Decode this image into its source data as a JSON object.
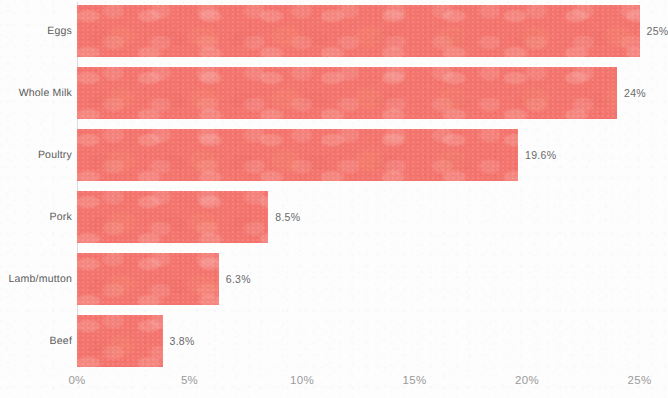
{
  "chart_data": {
    "type": "bar",
    "orientation": "horizontal",
    "title": "",
    "subtitle": "",
    "xlabel": "",
    "ylabel": "",
    "categories": [
      "Eggs",
      "Whole Milk",
      "Poultry",
      "Pork",
      "Lamb/mutton",
      "Beef"
    ],
    "values": [
      25,
      24,
      19.6,
      8.5,
      6.3,
      3.8
    ],
    "value_labels": [
      "25%",
      "24%",
      "19.6%",
      "8.5%",
      "6.3%",
      "3.8%"
    ],
    "xlim": [
      0,
      25
    ],
    "x_ticks": [
      0,
      5,
      10,
      15,
      20,
      25
    ],
    "x_tick_labels": [
      "0%",
      "5%",
      "10%",
      "15%",
      "20%",
      "25%"
    ],
    "grid": false,
    "legend": false,
    "bar_color": "#f4756e",
    "axis_line_color": "#dcdcdc",
    "tick_label_color": "#9a9a9a",
    "category_label_color": "#5b5b5b",
    "value_label_color": "#6a6a6a",
    "background_color": "#fdfdfd"
  }
}
